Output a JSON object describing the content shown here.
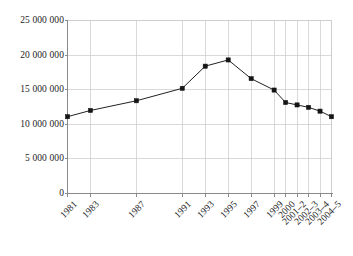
{
  "chart_data": {
    "type": "line",
    "title": "",
    "subtitle": "",
    "xlabel": "",
    "ylabel": "",
    "categories": [
      "1981",
      "1983",
      "1987",
      "1991",
      "1993",
      "1995",
      "1997",
      "1999",
      "2000",
      "2001–2",
      "2002–3",
      "2003–4",
      "2004–5"
    ],
    "values": [
      11100000,
      12000000,
      13400000,
      15200000,
      18400000,
      19300000,
      16600000,
      14950000,
      13150000,
      12800000,
      12450000,
      11900000,
      11100000
    ],
    "series": [
      {
        "name": "",
        "values": [
          11100000,
          12000000,
          13400000,
          15200000,
          18400000,
          19300000,
          16600000,
          14950000,
          13150000,
          12800000,
          12450000,
          11900000,
          11100000
        ]
      }
    ],
    "x_positions_years": [
      1981,
      1983,
      1987,
      1991,
      1993,
      1995,
      1997,
      1999,
      2000,
      2001,
      2002,
      2003,
      2004
    ],
    "ylim": [
      0,
      25000000
    ],
    "ytick_values": [
      0,
      5000000,
      10000000,
      15000000,
      20000000,
      25000000
    ],
    "ytick_labels": [
      "0",
      "5 000 000",
      "10 000 000",
      "15 000 000",
      "20 000 000",
      "25 000 000"
    ],
    "grid": {
      "horizontal": true,
      "vertical": true
    },
    "legend": {
      "visible": false,
      "position": "none"
    },
    "marker": "square",
    "colors": {
      "line": "#222222",
      "marker": "#151515",
      "grid": "#c9c9c9",
      "axis": "#8a8a8a",
      "background": "#ffffff",
      "text": "#1d1d1d"
    },
    "annotations": []
  }
}
